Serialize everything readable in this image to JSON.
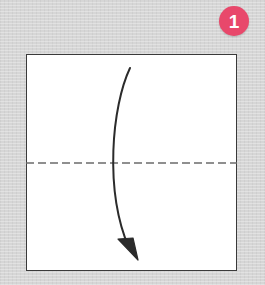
{
  "illustration": {
    "kind": "origami-fold-diagram",
    "description": "Square sheet of paper with a horizontal dashed valley-fold line across the middle and a curved arrow showing the top edge folding down to the bottom edge.",
    "background_color": "#d6d6d6"
  },
  "step_badge": {
    "number": "1",
    "circle_color": "#e8486b",
    "text_color": "#ffffff",
    "center_x": 234,
    "center_y": 21,
    "diameter": 30
  },
  "paper": {
    "label": "paper-square",
    "fill_color": "#ffffff",
    "stroke_color": "#3a3a3a",
    "x": 26,
    "y": 54,
    "width": 211,
    "height": 217
  },
  "fold_line": {
    "label": "valley-fold-dashed-line",
    "style": "dashed",
    "color": "#6b6b6b",
    "dash_length": 8,
    "dash_gap": 4,
    "stroke_width": 1.6,
    "x1": 26,
    "y1": 163,
    "x2": 237,
    "y2": 163
  },
  "fold_arrow": {
    "label": "fold-direction-arrow",
    "color": "#2b2b2b",
    "stroke_width": 2,
    "start_x": 130,
    "start_y": 68,
    "end_x": 129,
    "end_y": 248,
    "control_x": 104,
    "control_y": 160,
    "head_tip_x": 133,
    "head_tip_y": 258,
    "head_size": 13
  }
}
